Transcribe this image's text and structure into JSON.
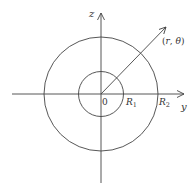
{
  "diagram": {
    "axes": {
      "horizontal_label": "y",
      "vertical_label": "z",
      "origin_label": "0"
    },
    "circles": [
      {
        "name": "inner",
        "radius_label": "R",
        "radius_sub": "1"
      },
      {
        "name": "outer",
        "radius_label": "R",
        "radius_sub": "2"
      }
    ],
    "point": {
      "label_open": "(",
      "r": "r",
      "comma": ", ",
      "theta": "θ",
      "label_close": ")"
    },
    "colors": {
      "stroke": "#444444",
      "text": "#333333"
    }
  }
}
